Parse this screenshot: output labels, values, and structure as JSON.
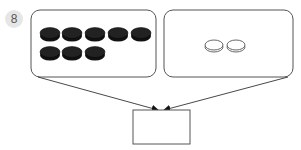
{
  "problem": {
    "number": "8"
  },
  "left_group": {
    "coin_color": "black",
    "count": 8,
    "rows": [
      5,
      3
    ]
  },
  "right_group": {
    "coin_color": "white",
    "count": 2
  },
  "answer_box": {
    "value": ""
  }
}
